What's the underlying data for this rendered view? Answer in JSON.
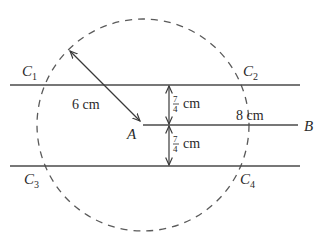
{
  "diagram": {
    "type": "geometry-construction",
    "colors": {
      "stroke": "#4a4a4a",
      "text": "#2a2a2a",
      "background": "#ffffff"
    },
    "points": {
      "A": {
        "label": "A"
      },
      "B": {
        "label": "B"
      },
      "C1": {
        "label": "C",
        "sub": "1"
      },
      "C2": {
        "label": "C",
        "sub": "2"
      },
      "C3": {
        "label": "C",
        "sub": "3"
      },
      "C4": {
        "label": "C",
        "sub": "4"
      }
    },
    "measurements": {
      "radius": "6 cm",
      "ab_length": "8 cm",
      "upper_distance_num": "7",
      "upper_distance_den": "4",
      "upper_distance_unit": "cm",
      "lower_distance_num": "7",
      "lower_distance_den": "4",
      "lower_distance_unit": "cm"
    },
    "elements": [
      "dashed circle centered at A with radius 6 cm",
      "segment AB of length 8 cm",
      "upper parallel line at distance 7/4 cm from AB",
      "lower parallel line at distance 7/4 cm from AB",
      "intersection points C1, C2, C3, C4"
    ]
  }
}
